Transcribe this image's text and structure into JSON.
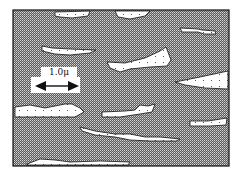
{
  "figure": {
    "type": "schematic micrograph",
    "matrix_fill": "dense dotted (dark) matrix",
    "particle_fill": "white with sparse dots",
    "colors": {
      "matrix": "#6a6a6a",
      "matrix_dot": "#d8d8d8",
      "particle": "#ffffff",
      "outline": "#111111"
    }
  },
  "scale_bar": {
    "label": "1.0μ",
    "length_value": 1.0,
    "unit": "μ",
    "arrow": "double-headed-arrow"
  },
  "particles_count": 13
}
